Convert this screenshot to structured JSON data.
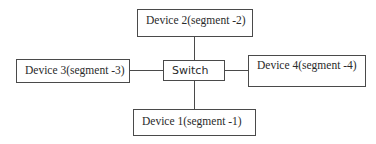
{
  "diagram": {
    "type": "star-network-topology",
    "center": {
      "label": "Switch"
    },
    "nodes": [
      {
        "id": "device-2",
        "label": "Device 2(segment -2)",
        "position": "top"
      },
      {
        "id": "device-3",
        "label": "Device 3(segment -3)",
        "position": "left"
      },
      {
        "id": "device-4",
        "label": "Device 4(segment -4)",
        "position": "right"
      },
      {
        "id": "device-1",
        "label": "Device 1(segment -1)",
        "position": "bottom"
      }
    ],
    "edges": [
      {
        "from": "Switch",
        "to": "device-2"
      },
      {
        "from": "Switch",
        "to": "device-3"
      },
      {
        "from": "Switch",
        "to": "device-4"
      },
      {
        "from": "Switch",
        "to": "device-1"
      }
    ]
  }
}
